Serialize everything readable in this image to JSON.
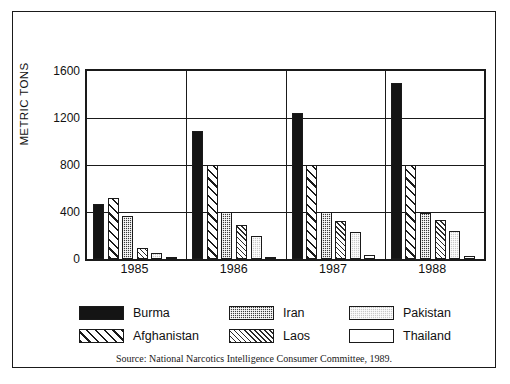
{
  "chart_data": {
    "type": "bar",
    "title": "",
    "xlabel": "",
    "ylabel": "METRIC TONS",
    "ylim": [
      0,
      1600
    ],
    "yticks": [
      0,
      400,
      800,
      1200,
      1600
    ],
    "grid": true,
    "legend_position": "bottom",
    "categories": [
      "1985",
      "1986",
      "1987",
      "1988"
    ],
    "series": [
      {
        "name": "Burma",
        "pattern": "solid-black",
        "values": [
          470,
          1090,
          1240,
          1500
        ]
      },
      {
        "name": "Afghanistan",
        "pattern": "wide-diagonal",
        "values": [
          520,
          800,
          800,
          800
        ]
      },
      {
        "name": "Iran",
        "pattern": "dark-dotted",
        "values": [
          370,
          400,
          400,
          395
        ]
      },
      {
        "name": "Laos",
        "pattern": "fine-diagonal",
        "values": [
          90,
          290,
          320,
          330
        ]
      },
      {
        "name": "Pakistan",
        "pattern": "light-gray-dotted",
        "values": [
          55,
          200,
          230,
          240
        ]
      },
      {
        "name": "Thailand",
        "pattern": "white",
        "values": [
          20,
          15,
          30,
          25
        ]
      }
    ],
    "source": "Source: National Narcotics Intelligence Consumer Committee, 1989."
  },
  "legend": {
    "items": [
      {
        "label": "Burma"
      },
      {
        "label": "Iran"
      },
      {
        "label": "Pakistan"
      },
      {
        "label": "Afghanistan"
      },
      {
        "label": "Laos"
      },
      {
        "label": "Thailand"
      }
    ]
  }
}
